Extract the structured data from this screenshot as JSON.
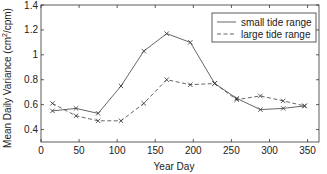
{
  "chart_data": {
    "type": "line",
    "title": "",
    "xlabel": "Year Day",
    "ylabel": "Mean Daily Variance (cm²/cpm)",
    "ylabel_parts": {
      "pre": "Mean Daily Variance (cm",
      "sup": "2",
      "post": "/cpm)"
    },
    "xlim": [
      0,
      365
    ],
    "ylim": [
      0.3,
      1.4
    ],
    "xticks": [
      0,
      50,
      100,
      150,
      200,
      250,
      300,
      350
    ],
    "yticks": [
      0.4,
      0.6,
      0.8,
      1,
      1.2,
      1.4
    ],
    "ytick_labels": [
      "0.4",
      "0.6",
      "0.8",
      "1",
      "1.2",
      "1.4"
    ],
    "grid": false,
    "legend_position": "upper right",
    "x": [
      15,
      46,
      75,
      105,
      135,
      165,
      196,
      228,
      257,
      288,
      318,
      346
    ],
    "series": [
      {
        "name": "small tide range",
        "style": "solid",
        "marker": "x",
        "values": [
          0.55,
          0.57,
          0.53,
          0.75,
          1.03,
          1.17,
          1.1,
          0.77,
          0.65,
          0.56,
          0.57,
          0.59
        ]
      },
      {
        "name": "large tide range",
        "style": "dashed",
        "marker": "x",
        "values": [
          0.61,
          0.51,
          0.47,
          0.47,
          0.61,
          0.8,
          0.76,
          0.77,
          0.64,
          0.67,
          0.63,
          0.59
        ]
      }
    ]
  },
  "colors": {
    "line": "#555555",
    "axis": "#333333",
    "background": "#ffffff"
  }
}
